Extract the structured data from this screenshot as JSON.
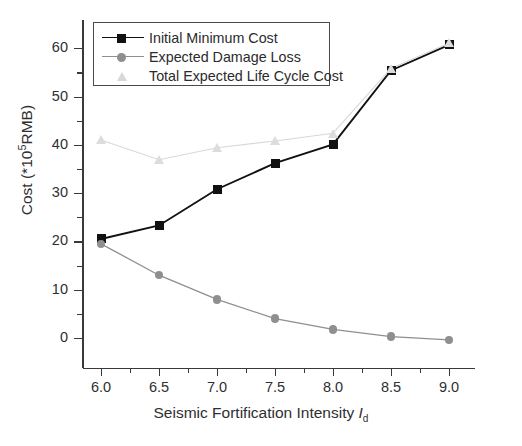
{
  "chart_data": {
    "type": "line",
    "title": "",
    "xlabel": "Seismic Fortification Intensity I_d",
    "xlabel_main": "Seismic Fortification Intensity ",
    "xlabel_symbol": "I",
    "xlabel_subscript": "d",
    "ylabel": "Cost (*10^5 RMB)",
    "ylabel_prefix": "Cost (*10",
    "ylabel_superscript": "5",
    "ylabel_suffix": "RMB)",
    "x": [
      6.0,
      6.5,
      7.0,
      7.5,
      8.0,
      8.5,
      9.0
    ],
    "xtick_labels": [
      "6.0",
      "6.5",
      "7.0",
      "7.5",
      "8.0",
      "8.5",
      "9.0"
    ],
    "ytick_labels": [
      "0",
      "10",
      "20",
      "30",
      "40",
      "50",
      "60"
    ],
    "xlim": [
      5.8,
      9.2
    ],
    "ylim": [
      -4,
      65
    ],
    "grid": false,
    "legend_position": "top-left",
    "series": [
      {
        "name": "Initial Minimum Cost",
        "marker": "square",
        "color": "#111111",
        "values": [
          20.5,
          23.3,
          30.8,
          36.2,
          40.1,
          55.4,
          60.7
        ]
      },
      {
        "name": "Expected Damage Loss",
        "marker": "circle",
        "color": "#8f8f8f",
        "values": [
          19.5,
          13.0,
          8.0,
          4.0,
          1.8,
          0.3,
          -0.4
        ]
      },
      {
        "name": "Total Expected Life Cycle Cost",
        "marker": "triangle",
        "color": "#d8d8d8",
        "values": [
          41.0,
          36.9,
          39.4,
          40.8,
          42.4,
          55.8,
          61.1
        ]
      }
    ]
  },
  "legend": {
    "items": [
      {
        "label": "Initial Minimum Cost",
        "marker": "square",
        "color": "#111111",
        "show_line": true
      },
      {
        "label": "Expected Damage Loss",
        "marker": "circle",
        "color": "#8f8f8f",
        "show_line": true
      },
      {
        "label": "Total Expected Life Cycle Cost",
        "marker": "triangle",
        "color": "#d8d8d8",
        "show_line": false
      }
    ]
  }
}
